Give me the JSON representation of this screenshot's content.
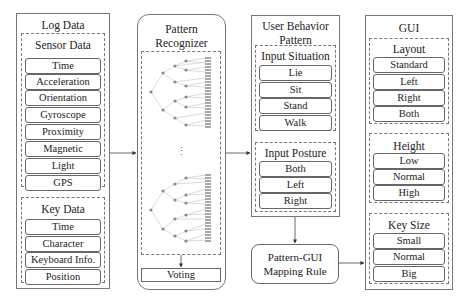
{
  "log_data": {
    "title": "Log Data",
    "sensor_data": {
      "title": "Sensor Data",
      "items": [
        "Time",
        "Acceleration",
        "Orientation",
        "Gyroscope",
        "Proximity",
        "Magnetic",
        "Light",
        "GPS"
      ]
    },
    "key_data": {
      "title": "Key Data",
      "items": [
        "Time",
        "Character",
        "Keyboard Info.",
        "Position"
      ]
    }
  },
  "pattern_recognizer": {
    "title_line1": "Pattern",
    "title_line2": "Recognizer",
    "ellipsis": "⋮",
    "voting": "Voting"
  },
  "user_behavior": {
    "title_line1": "User Behavior",
    "title_line2": "Pattern",
    "input_situation": {
      "title": "Input Situation",
      "items": [
        "Lie",
        "Sit",
        "Stand",
        "Walk"
      ]
    },
    "input_posture": {
      "title": "Input Posture",
      "items": [
        "Both",
        "Left",
        "Right"
      ]
    }
  },
  "mapping_rule": {
    "line1": "Pattern-GUI",
    "line2": "Mapping Rule"
  },
  "gui": {
    "title": "GUI",
    "layout": {
      "title": "Layout",
      "items": [
        "Standard",
        "Left",
        "Right",
        "Both"
      ]
    },
    "height": {
      "title": "Height",
      "items": [
        "Low",
        "Normal",
        "High"
      ]
    },
    "key_size": {
      "title": "Key Size",
      "items": [
        "Small",
        "Normal",
        "Big"
      ]
    }
  },
  "colors": {
    "border": "#777777",
    "tree_node": "#888888",
    "tree_line": "#bbbbbb",
    "leaf": "#999999"
  }
}
